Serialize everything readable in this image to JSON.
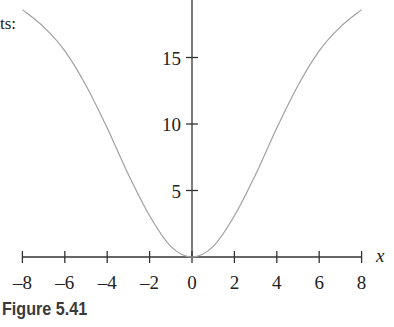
{
  "page": {
    "text_fragment": "ts:",
    "caption": "Figure 5.41"
  },
  "chart_data": {
    "type": "line",
    "title": "",
    "xlabel": "x",
    "ylabel": "",
    "xlim": [
      -8,
      8
    ],
    "ylim": [
      0,
      20
    ],
    "x_ticks": [
      -8,
      -6,
      -4,
      -2,
      0,
      2,
      4,
      6,
      8
    ],
    "x_tick_labels": [
      "–8",
      "–6",
      "–4",
      "–2",
      "0",
      "2",
      "4",
      "6",
      "8"
    ],
    "y_ticks": [
      5,
      10,
      15
    ],
    "y_tick_labels": [
      "5",
      "10",
      "15"
    ],
    "grid": false,
    "series": [
      {
        "name": "curve",
        "color": "#a0a0a0",
        "x": [
          -8,
          -7,
          -6,
          -5,
          -4,
          -3,
          -2,
          -1,
          0,
          1,
          2,
          3,
          4,
          5,
          6,
          7,
          8
        ],
        "values": [
          18.6,
          17.3,
          15.5,
          12.9,
          9.7,
          6.2,
          3.1,
          0.8,
          0,
          0.8,
          3.1,
          6.2,
          9.7,
          12.9,
          15.5,
          17.3,
          18.6
        ]
      }
    ]
  }
}
